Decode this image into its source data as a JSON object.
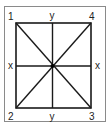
{
  "diagram": {
    "corner_labels": {
      "top_left": "1",
      "bottom_left": "2",
      "bottom_right": "3",
      "top_right": "4"
    },
    "axis_labels": {
      "top": "y",
      "bottom": "y",
      "left": "x",
      "right": "x"
    },
    "colors": {
      "line": "#1a1a1a",
      "frame": "#8a8a8a",
      "background": "#ffffff"
    }
  }
}
